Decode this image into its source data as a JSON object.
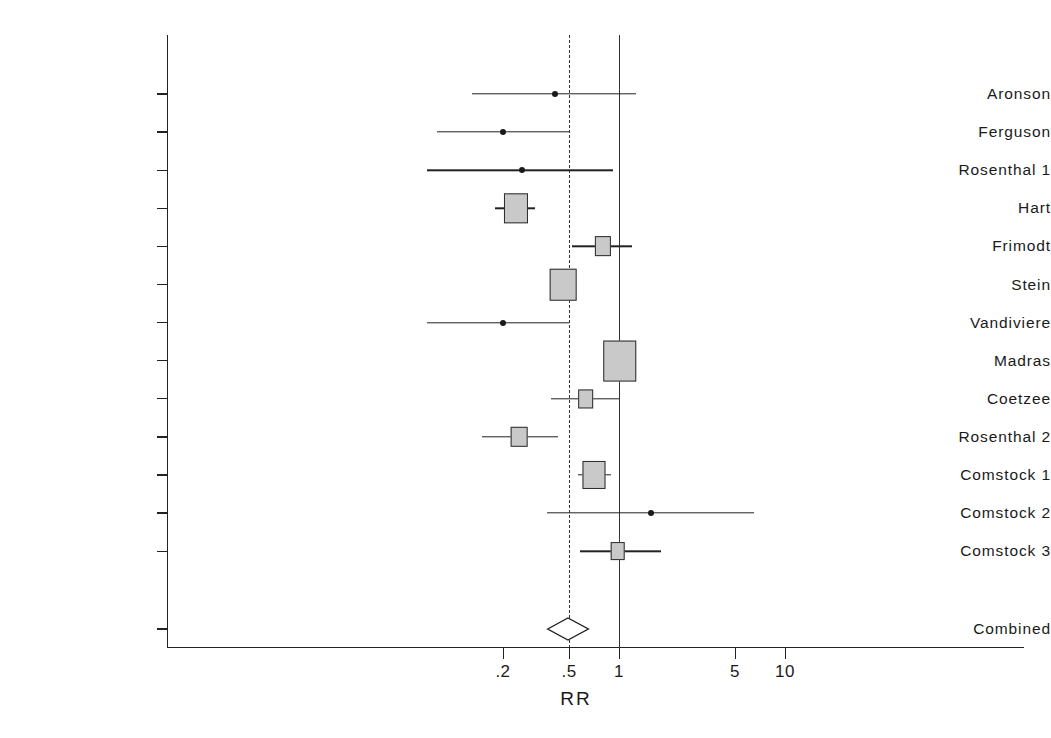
{
  "chart_data": {
    "type": "forest",
    "title": "",
    "xlabel": "RR",
    "ylabel": "",
    "scale": "log",
    "xlim": [
      0.13,
      11.5
    ],
    "xticks": [
      0.2,
      0.5,
      1,
      5,
      10
    ],
    "xticklabels": [
      ".2",
      ".5",
      "1",
      "5",
      "10"
    ],
    "grid": false,
    "reference_lines": [
      {
        "value": 0.5,
        "style": "dashed"
      },
      {
        "value": 1.0,
        "style": "solid"
      }
    ],
    "categories": [
      "Aronson",
      "Ferguson",
      "Rosenthal 1",
      "Hart",
      "Frimodt",
      "Stein",
      "Vandiviere",
      "Madras",
      "Coetzee",
      "Rosenthal 2",
      "Comstock 1",
      "Comstock 2",
      "Comstock 3"
    ],
    "studies": [
      {
        "label": "Aronson",
        "rr": 0.41,
        "ci_low": 0.13,
        "ci_high": 1.26,
        "weight": 0.02,
        "marker": "dot"
      },
      {
        "label": "Ferguson",
        "rr": 0.2,
        "ci_low": 0.08,
        "ci_high": 0.5,
        "weight": 0.03,
        "marker": "dot"
      },
      {
        "label": "Rosenthal 1",
        "rr": 0.26,
        "ci_low": 0.07,
        "ci_high": 0.92,
        "weight": 0.02,
        "marker": "dot"
      },
      {
        "label": "Hart",
        "rr": 0.24,
        "ci_low": 0.18,
        "ci_high": 0.31,
        "weight": 0.24,
        "marker": "box"
      },
      {
        "label": "Frimodt",
        "rr": 0.8,
        "ci_low": 0.52,
        "ci_high": 1.2,
        "weight": 0.09,
        "marker": "box"
      },
      {
        "label": "Stein",
        "rr": 0.46,
        "ci_low": 0.39,
        "ci_high": 0.54,
        "weight": 0.29,
        "marker": "box"
      },
      {
        "label": "Vandiviere",
        "rr": 0.2,
        "ci_low": 0.07,
        "ci_high": 0.5,
        "weight": 0.02,
        "marker": "dot"
      },
      {
        "label": "Madras",
        "rr": 1.01,
        "ci_low": 0.89,
        "ci_high": 1.15,
        "weight": 0.42,
        "marker": "box"
      },
      {
        "label": "Coetzee",
        "rr": 0.63,
        "ci_low": 0.39,
        "ci_high": 1.0,
        "weight": 0.08,
        "marker": "box"
      },
      {
        "label": "Rosenthal 2",
        "rr": 0.25,
        "ci_low": 0.15,
        "ci_high": 0.43,
        "weight": 0.1,
        "marker": "box"
      },
      {
        "label": "Comstock 1",
        "rr": 0.71,
        "ci_low": 0.57,
        "ci_high": 0.89,
        "weight": 0.22,
        "marker": "box"
      },
      {
        "label": "Comstock 2",
        "rr": 1.56,
        "ci_low": 0.37,
        "ci_high": 6.53,
        "weight": 0.02,
        "marker": "dot"
      },
      {
        "label": "Comstock 3",
        "rr": 0.98,
        "ci_low": 0.58,
        "ci_high": 1.8,
        "weight": 0.06,
        "marker": "box"
      }
    ],
    "combined": {
      "label": "Combined",
      "rr": 0.49,
      "ci_low": 0.37,
      "ci_high": 0.65,
      "marker": "diamond"
    }
  },
  "colors": {
    "axis": "#222222",
    "marker_fill": "#c9c9c9",
    "marker_border": "#2b2b2b",
    "line": "#222222",
    "background": "#ffffff"
  }
}
